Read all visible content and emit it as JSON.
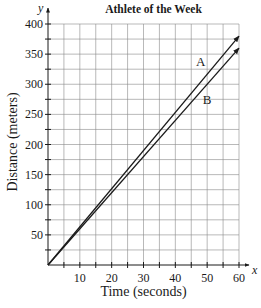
{
  "chart_data": {
    "type": "line",
    "title": "Athlete of the Week",
    "xlabel": "Time (seconds)",
    "ylabel": "Distance (meters)",
    "x_axis_symbol": "x",
    "y_axis_symbol": "y",
    "xlim": [
      0,
      60
    ],
    "ylim": [
      0,
      400
    ],
    "x_ticks": [
      10,
      20,
      30,
      40,
      50,
      60
    ],
    "y_ticks": [
      50,
      100,
      150,
      200,
      250,
      300,
      350,
      400
    ],
    "x_tick_labels": [
      "10",
      "20",
      "30",
      "40",
      "50",
      "60"
    ],
    "y_tick_labels": [
      "50",
      "100",
      "150",
      "200",
      "250",
      "300",
      "350",
      "400"
    ],
    "grid": true,
    "minor_grid_x_step": 5,
    "minor_grid_y_step": 25,
    "series": [
      {
        "name": "A",
        "x": [
          0,
          60
        ],
        "y": [
          0,
          380
        ],
        "arrow_end": true
      },
      {
        "name": "B",
        "x": [
          0,
          60
        ],
        "y": [
          0,
          360
        ],
        "arrow_end": true
      }
    ],
    "annotations": [
      {
        "text": "A",
        "x": 48,
        "y": 330
      },
      {
        "text": "B",
        "x": 50,
        "y": 268
      }
    ],
    "legend": "none (inline labels)"
  },
  "colors": {
    "line": "#1a1a1a",
    "grid": "#8a8a8a",
    "background": "#ffffff"
  }
}
